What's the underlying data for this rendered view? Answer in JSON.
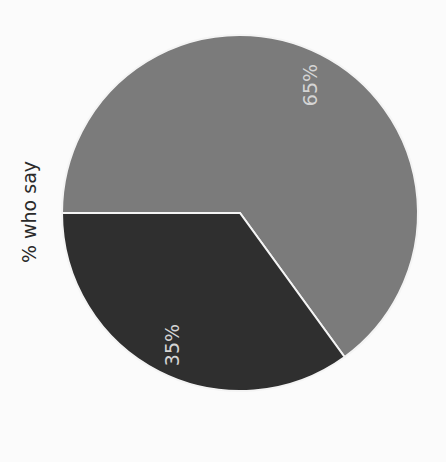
{
  "chart_data": {
    "type": "pie",
    "title": "",
    "ylabel": "% who say",
    "categories": [
      "Slice A",
      "Slice B"
    ],
    "values": [
      65,
      35
    ],
    "labels": [
      "65%",
      "35%"
    ],
    "colors": [
      "#7b7b7b",
      "#2f2f2f"
    ],
    "orientation": "rotated -90deg",
    "legend": null
  },
  "axis_label": "% who say",
  "slices": [
    {
      "label": "65%",
      "value": 65,
      "color": "#7b7b7b"
    },
    {
      "label": "35%",
      "value": 35,
      "color": "#2f2f2f"
    }
  ]
}
